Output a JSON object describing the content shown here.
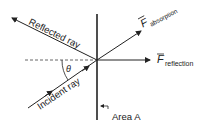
{
  "labels": {
    "reflected_ray": "Reflected ray",
    "incident_ray": "Incident ray",
    "theta": "θ",
    "f_absorption_main": "F",
    "f_absorption_sub": "absorption",
    "f_reflection_main": "F",
    "f_reflection_sub": "reflection",
    "area": "Area A"
  },
  "colors": {
    "line": "#222222",
    "dashed": "#555555"
  }
}
